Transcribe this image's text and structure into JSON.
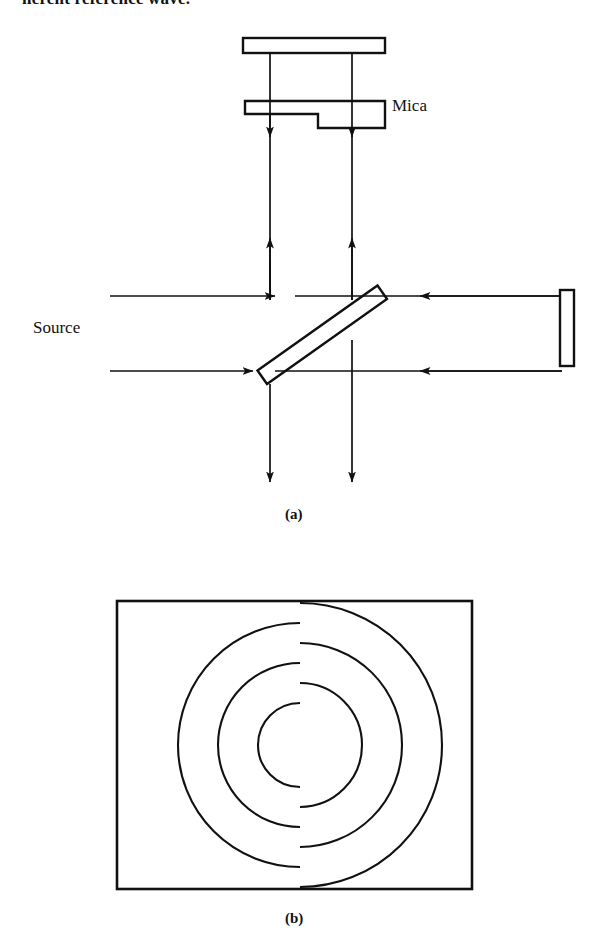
{
  "page": {
    "width": 591,
    "height": 946,
    "background": "#ffffff",
    "ink_color": "#111111",
    "running_text": "herent reference wave."
  },
  "figure": {
    "kind": "optics-schematic-and-fringe-pattern",
    "panels": [
      {
        "id": "a",
        "caption": "(a)",
        "title": "Interferometer with mica step in one arm",
        "labels": [
          {
            "name": "mica-label",
            "text": "Mica"
          },
          {
            "name": "source-label",
            "text": "Source"
          }
        ],
        "components": [
          {
            "name": "top-mirror",
            "type": "mirror",
            "shape": "horizontal-rectangle"
          },
          {
            "name": "mica-step-plate",
            "type": "mica",
            "shape": "stepped-plate"
          },
          {
            "name": "beam-splitter",
            "type": "beam-splitter",
            "shape": "tilted-plate"
          },
          {
            "name": "right-mirror",
            "type": "mirror",
            "shape": "vertical-rectangle"
          }
        ],
        "beams": [
          {
            "name": "source-beam-upper",
            "direction": "right"
          },
          {
            "name": "source-beam-lower",
            "direction": "right"
          },
          {
            "name": "reference-beam-upper",
            "direction": "left"
          },
          {
            "name": "reference-beam-lower",
            "direction": "left"
          },
          {
            "name": "vertical-beam-up-left",
            "direction": "up"
          },
          {
            "name": "vertical-beam-up-right",
            "direction": "up"
          },
          {
            "name": "vertical-beam-down-left",
            "direction": "down"
          },
          {
            "name": "vertical-beam-down-right",
            "direction": "down"
          }
        ]
      },
      {
        "id": "b",
        "caption": "(b)",
        "title": "Observed fringe pattern with dislocation",
        "frame": {
          "x": 117,
          "y": 601,
          "width": 355,
          "height": 288
        }
      }
    ]
  },
  "chart_data": {
    "type": "scatter",
    "xlabel": "",
    "ylabel": "",
    "frame": {
      "x": 117,
      "y": 601,
      "width": 355,
      "height": 288
    },
    "center": {
      "x": 300,
      "y": 745
    },
    "dislocation_line_x": 300,
    "left_arcs": [
      {
        "radius": 42,
        "start_deg": 90,
        "end_deg": 270
      },
      {
        "radius": 82,
        "start_deg": 90,
        "end_deg": 270
      },
      {
        "radius": 122,
        "start_deg": 90,
        "end_deg": 270
      }
    ],
    "right_arcs": [
      {
        "radius": 62,
        "start_deg": -90,
        "end_deg": 90
      },
      {
        "radius": 102,
        "start_deg": -90,
        "end_deg": 90
      },
      {
        "radius": 142,
        "start_deg": -90,
        "end_deg": 90
      }
    ]
  }
}
